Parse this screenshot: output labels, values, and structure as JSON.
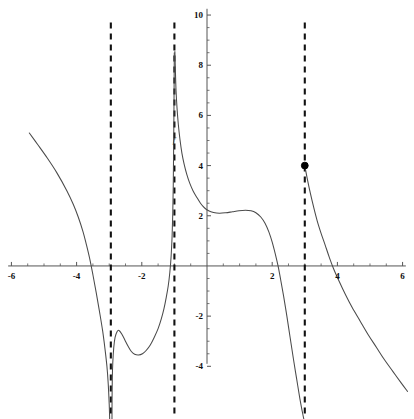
{
  "chart_data": {
    "type": "line",
    "title": "",
    "subtitle": "",
    "xlabel": "",
    "ylabel": "",
    "xlim": [
      -6.35,
      6.35
    ],
    "ylim": [
      -6.1,
      10.6
    ],
    "grid": false,
    "legend": null,
    "axis_color": "#555555",
    "curve_color": "#4a4a4a",
    "asymptote_color": "#111111",
    "point_color": "#000000",
    "x_ticks_labeled": [
      -6,
      -4,
      -2,
      2,
      4,
      6
    ],
    "y_ticks_labeled": [
      10,
      8,
      6,
      4,
      2,
      -2,
      -4
    ],
    "x_tick_labels": [
      "-6",
      "-4",
      "-2",
      "2",
      "4",
      "6"
    ],
    "y_tick_labels": [
      "10",
      "8",
      "6",
      "4",
      "2",
      "-2",
      "-4"
    ],
    "x_minor_tick_step": 0.5,
    "y_minor_tick_step": 0.5,
    "asymptotes": [
      {
        "name": "vertical-asymptote-1",
        "x": -2.95,
        "style": "dashed"
      },
      {
        "name": "vertical-asymptote-2",
        "x": -1.0,
        "style": "dashed"
      },
      {
        "name": "vertical-asymptote-3",
        "x": 3.0,
        "style": "dashed"
      }
    ],
    "points": [
      {
        "name": "endpoint-filled-dot",
        "x": 3.0,
        "y": 4.0,
        "marker": "filled-circle"
      }
    ],
    "annotations": [
      {
        "name": "y-axis-curve-label",
        "text": "f",
        "x": -1.05,
        "y": 4.9
      }
    ],
    "branches": [
      {
        "name": "branch-far-left",
        "comment": "descends from upper-left, crosses x-axis near -3.8, plunges down along asymptote x=-2.95",
        "points": [
          [
            -5.45,
            5.3
          ],
          [
            -5.2,
            4.85
          ],
          [
            -4.9,
            4.3
          ],
          [
            -4.6,
            3.7
          ],
          [
            -4.3,
            3.0
          ],
          [
            -4.1,
            2.45
          ],
          [
            -3.95,
            1.95
          ],
          [
            -3.8,
            1.35
          ],
          [
            -3.7,
            0.85
          ],
          [
            -3.6,
            0.3
          ],
          [
            -3.5,
            -0.35
          ],
          [
            -3.4,
            -1.05
          ],
          [
            -3.3,
            -1.8
          ],
          [
            -3.2,
            -2.6
          ],
          [
            -3.13,
            -3.3
          ],
          [
            -3.07,
            -4.0
          ],
          [
            -3.03,
            -4.7
          ],
          [
            -3.0,
            -5.5
          ],
          [
            -2.985,
            -6.1
          ]
        ]
      },
      {
        "name": "branch-middle-left",
        "comment": "rises out of asymptote x=-2.95, local max near (-2.70,-2.57), local min near (-2.22,-3.52), then sweeps up to asymptote x=-1",
        "points": [
          [
            -2.915,
            -6.1
          ],
          [
            -2.912,
            -5.3
          ],
          [
            -2.905,
            -4.5
          ],
          [
            -2.89,
            -3.85
          ],
          [
            -2.86,
            -3.25
          ],
          [
            -2.82,
            -2.85
          ],
          [
            -2.76,
            -2.62
          ],
          [
            -2.7,
            -2.57
          ],
          [
            -2.62,
            -2.7
          ],
          [
            -2.52,
            -2.95
          ],
          [
            -2.42,
            -3.2
          ],
          [
            -2.32,
            -3.41
          ],
          [
            -2.22,
            -3.52
          ],
          [
            -2.1,
            -3.55
          ],
          [
            -1.98,
            -3.5
          ],
          [
            -1.86,
            -3.36
          ],
          [
            -1.74,
            -3.15
          ],
          [
            -1.62,
            -2.85
          ],
          [
            -1.5,
            -2.5
          ],
          [
            -1.4,
            -2.1
          ],
          [
            -1.32,
            -1.7
          ],
          [
            -1.25,
            -1.25
          ],
          [
            -1.19,
            -0.8
          ],
          [
            -1.14,
            -0.25
          ],
          [
            -1.1,
            0.4
          ],
          [
            -1.07,
            1.2
          ],
          [
            -1.05,
            2.1
          ],
          [
            -1.035,
            3.2
          ],
          [
            -1.025,
            4.5
          ],
          [
            -1.015,
            6.0
          ],
          [
            -1.008,
            7.4
          ],
          [
            -1.003,
            8.5
          ]
        ]
      },
      {
        "name": "branch-middle-right",
        "comment": "comes down from the top right of asymptote x=-1, flattens to plateau near y=2.1-2.2, then falls through x-axis near 2.2 and plunges beside asymptote x=3",
        "points": [
          [
            -0.985,
            8.55
          ],
          [
            -0.97,
            7.8
          ],
          [
            -0.95,
            7.0
          ],
          [
            -0.92,
            6.3
          ],
          [
            -0.88,
            5.65
          ],
          [
            -0.83,
            5.05
          ],
          [
            -0.77,
            4.5
          ],
          [
            -0.7,
            4.05
          ],
          [
            -0.62,
            3.65
          ],
          [
            -0.53,
            3.3
          ],
          [
            -0.43,
            3.0
          ],
          [
            -0.32,
            2.75
          ],
          [
            -0.2,
            2.5
          ],
          [
            -0.08,
            2.32
          ],
          [
            0.05,
            2.2
          ],
          [
            0.2,
            2.13
          ],
          [
            0.38,
            2.1
          ],
          [
            0.58,
            2.12
          ],
          [
            0.78,
            2.16
          ],
          [
            0.98,
            2.2
          ],
          [
            1.18,
            2.22
          ],
          [
            1.35,
            2.2
          ],
          [
            1.5,
            2.12
          ],
          [
            1.65,
            1.95
          ],
          [
            1.78,
            1.7
          ],
          [
            1.9,
            1.35
          ],
          [
            2.0,
            0.95
          ],
          [
            2.1,
            0.45
          ],
          [
            2.18,
            0.0
          ],
          [
            2.26,
            -0.55
          ],
          [
            2.35,
            -1.2
          ],
          [
            2.45,
            -2.0
          ],
          [
            2.55,
            -2.85
          ],
          [
            2.65,
            -3.7
          ],
          [
            2.75,
            -4.5
          ],
          [
            2.85,
            -5.3
          ],
          [
            2.93,
            -5.85
          ],
          [
            2.97,
            -6.1
          ]
        ]
      },
      {
        "name": "branch-far-right",
        "comment": "starts at filled point (3,4), falls steeply, crosses x-axis near 3.75, then descends gently to the lower right",
        "points": [
          [
            3.0,
            4.0
          ],
          [
            3.08,
            3.45
          ],
          [
            3.17,
            2.9
          ],
          [
            3.27,
            2.35
          ],
          [
            3.38,
            1.8
          ],
          [
            3.5,
            1.3
          ],
          [
            3.62,
            0.85
          ],
          [
            3.75,
            0.35
          ],
          [
            3.88,
            -0.1
          ],
          [
            4.05,
            -0.6
          ],
          [
            4.25,
            -1.15
          ],
          [
            4.45,
            -1.65
          ],
          [
            4.7,
            -2.2
          ],
          [
            4.95,
            -2.75
          ],
          [
            5.2,
            -3.25
          ],
          [
            5.45,
            -3.75
          ],
          [
            5.7,
            -4.2
          ],
          [
            5.95,
            -4.65
          ],
          [
            6.15,
            -5.0
          ]
        ]
      }
    ]
  }
}
